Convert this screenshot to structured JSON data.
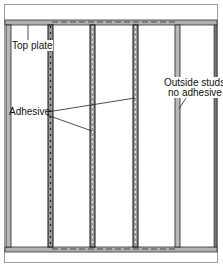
{
  "diagram": {
    "type": "wall-framing",
    "labels": {
      "top_plate": "Top plate",
      "adhesive": "Adhesive",
      "outside_studs_line1": "Outside studs",
      "outside_studs_line2": "no adhesive"
    },
    "studs": [
      {
        "id": "left-outside",
        "adhesive": false
      },
      {
        "id": "stud-2",
        "adhesive": true
      },
      {
        "id": "stud-3",
        "adhesive": true
      },
      {
        "id": "stud-4",
        "adhesive": true
      },
      {
        "id": "right-outside",
        "adhesive": false
      }
    ],
    "colors": {
      "plate": "#a8a8a8",
      "stud_outline": "#222222",
      "adhesive": "#555555"
    }
  }
}
